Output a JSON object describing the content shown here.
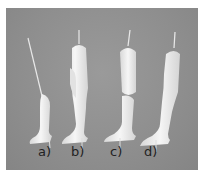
{
  "image": {
    "description": "Photograph of four white doll leg parts on pins against a gray background",
    "background_color": "#8f8f8f",
    "part_color": "#ececec"
  },
  "labels": [
    {
      "id": "a",
      "text": "a)"
    },
    {
      "id": "b",
      "text": "b)"
    },
    {
      "id": "c",
      "text": "c)"
    },
    {
      "id": "d",
      "text": "d)"
    }
  ]
}
